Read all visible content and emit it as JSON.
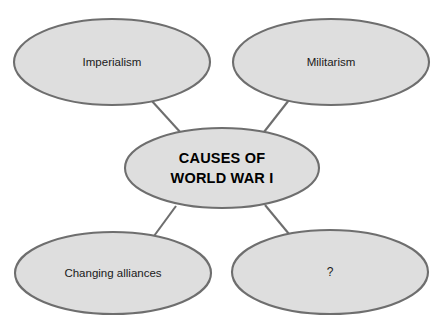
{
  "diagram": {
    "type": "concept-map",
    "title_node": {
      "id": "center",
      "line1": "CAUSES OF",
      "line2": "WORLD WAR I",
      "cx": 222,
      "cy": 168,
      "rx": 97,
      "ry": 40
    },
    "colors": {
      "node_fill": "#dedede",
      "node_stroke": "#6e6e6e",
      "connector": "#6e6e6e",
      "text": "#1a1a1a",
      "background": "#ffffff"
    },
    "nodes": [
      {
        "id": "imperialism",
        "label": "Imperialism",
        "cx": 112,
        "cy": 62,
        "rx": 98,
        "ry": 43
      },
      {
        "id": "militarism",
        "label": "Militarism",
        "cx": 331,
        "cy": 62,
        "rx": 98,
        "ry": 43
      },
      {
        "id": "changing-alliances",
        "label": "Changing alliances",
        "cx": 113,
        "cy": 273,
        "rx": 98,
        "ry": 41
      },
      {
        "id": "unknown-cause",
        "label": "?",
        "cx": 330,
        "cy": 272,
        "rx": 98,
        "ry": 42
      }
    ],
    "connectors": [
      {
        "id": "imperialism-to-center",
        "from": "imperialism",
        "to": "center",
        "x1": 151,
        "y1": 100,
        "x2": 181,
        "y2": 133
      },
      {
        "id": "militarism-to-center",
        "from": "militarism",
        "to": "center",
        "x1": 289,
        "y1": 100,
        "x2": 264,
        "y2": 132
      },
      {
        "id": "center-to-changing-alliances",
        "from": "center",
        "to": "changing-alliances",
        "x1": 176,
        "y1": 206,
        "x2": 154,
        "y2": 236
      },
      {
        "id": "center-to-unknown",
        "from": "center",
        "to": "unknown-cause",
        "x1": 265,
        "y1": 205,
        "x2": 289,
        "y2": 234
      }
    ]
  }
}
